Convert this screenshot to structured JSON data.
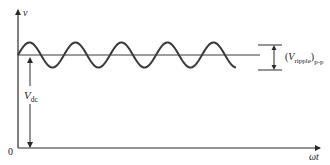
{
  "diagram": {
    "title": "",
    "axes": {
      "y_label": "v",
      "x_label": "ωt",
      "origin_label": "0"
    },
    "annotations": {
      "vdc": {
        "main": "V",
        "sub": "dc"
      },
      "ripple": {
        "open_paren": "(",
        "main": "V",
        "sub": "ripple",
        "close_paren": ")",
        "sub2": "p-p"
      }
    },
    "waveform": {
      "type": "sinusoidal ripple on DC level",
      "cycles": 4.75,
      "dc_level_label": "V_dc",
      "peak_to_peak_label": "(V_ripple)p-p"
    },
    "colors": {
      "stroke": "#2a2a2a",
      "wave": "#3a3a3a",
      "background": "#ffffff"
    }
  }
}
